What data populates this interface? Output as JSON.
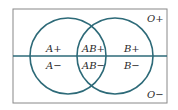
{
  "diagram": {
    "type": "venn",
    "colors": {
      "stroke": "#2d6a78",
      "frame": "#888888",
      "text": "#2a2a2a"
    },
    "sets": [
      "A",
      "B"
    ],
    "regions": {
      "a_pos": "A+",
      "a_neg": "A−",
      "ab_pos": "AB+",
      "ab_neg": "AB−",
      "b_pos": "B+",
      "b_neg": "B−",
      "o_pos": "O+",
      "o_neg": "O−"
    }
  }
}
